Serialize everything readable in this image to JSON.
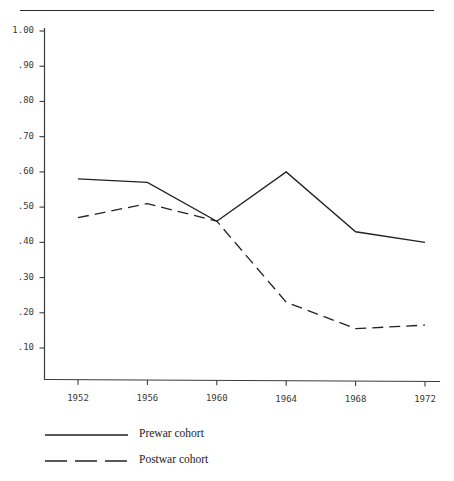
{
  "chart_data": {
    "type": "line",
    "title": "",
    "subtitle": "",
    "xlabel": "",
    "ylabel": "",
    "categories": [
      "1952",
      "1956",
      "1960",
      "1964",
      "1968",
      "1972"
    ],
    "x": [
      1952,
      1956,
      1960,
      1964,
      1968,
      1972
    ],
    "xlim": [
      1952,
      1972
    ],
    "ylim": [
      0.0,
      1.0
    ],
    "grid": false,
    "legend_position": "bottom-left",
    "y_tick_labels": [
      "1.00",
      ".90",
      ".80",
      ".70",
      ".60",
      ".50",
      ".40",
      ".30",
      ".20",
      ".10"
    ],
    "y_tick_values": [
      1.0,
      0.9,
      0.8,
      0.7,
      0.6,
      0.5,
      0.4,
      0.3,
      0.2,
      0.1
    ],
    "x_tick_labels": [
      "1952",
      "1956",
      "1960",
      "1964",
      "1968",
      "1972"
    ],
    "series": [
      {
        "name": "Prewar cohort",
        "style": "solid",
        "color": "#222222",
        "values": [
          0.58,
          0.57,
          0.46,
          0.6,
          0.43,
          0.4
        ]
      },
      {
        "name": "Postwar cohort",
        "style": "dashed",
        "color": "#222222",
        "values": [
          0.47,
          0.51,
          0.46,
          0.23,
          0.155,
          0.165
        ]
      }
    ]
  },
  "legend": {
    "items": [
      {
        "label": "Prewar cohort",
        "style": "solid"
      },
      {
        "label": "Postwar cohort",
        "style": "dashed"
      }
    ]
  },
  "axes": {
    "y_labels": [
      "1.00",
      ".90",
      ".80",
      ".70",
      ".60",
      ".50",
      ".40",
      ".30",
      ".20",
      ".10"
    ],
    "x_labels": [
      "1952",
      "1956",
      "1960",
      "1964",
      "1968",
      "1972"
    ]
  },
  "colors": {
    "ink": "#222222",
    "axis": "#3a3a3a",
    "background": "#ffffff"
  }
}
